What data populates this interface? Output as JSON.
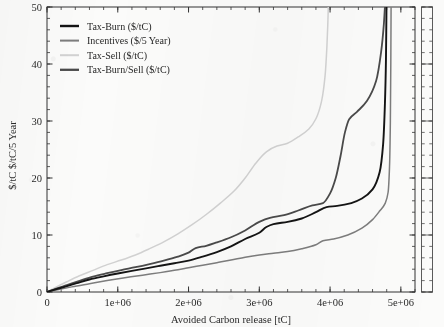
{
  "chart_data": {
    "type": "line",
    "title": "",
    "xlabel": "Avoided Carbon release [tC]",
    "ylabel": "$/tC   $/tC/5 Year",
    "ylabel_parts": [
      "$/tC",
      "$/tC/5 Year"
    ],
    "xlim": [
      0,
      5200000
    ],
    "ylim": [
      0,
      50
    ],
    "xticks": [
      0,
      1000000,
      2000000,
      3000000,
      4000000,
      5000000
    ],
    "xticklabels": [
      "0",
      "1e+06",
      "2e+06",
      "3e+06",
      "4e+06",
      "5e+06"
    ],
    "yticks": [
      0,
      10,
      20,
      30,
      40,
      50
    ],
    "yticklabels": [
      "0",
      "10",
      "20",
      "30",
      "40",
      "50"
    ],
    "x_minor_tick_interval": 200000,
    "y_minor_tick_interval": 2,
    "grid": false,
    "legend_position": "upper left",
    "series": [
      {
        "name": "Tax-Burn ($/tC)",
        "color": "#141414",
        "width": 1.9,
        "points": [
          [
            0,
            0
          ],
          [
            120000,
            0.45
          ],
          [
            260000,
            0.95
          ],
          [
            420000,
            1.55
          ],
          [
            600000,
            2.2
          ],
          [
            800000,
            2.75
          ],
          [
            1000000,
            3.25
          ],
          [
            1200000,
            3.7
          ],
          [
            1400000,
            4.15
          ],
          [
            1600000,
            4.6
          ],
          [
            1800000,
            5.05
          ],
          [
            2000000,
            5.5
          ],
          [
            2200000,
            6.2
          ],
          [
            2400000,
            7.0
          ],
          [
            2600000,
            8.0
          ],
          [
            2800000,
            9.3
          ],
          [
            3000000,
            10.4
          ],
          [
            3100000,
            11.4
          ],
          [
            3200000,
            11.9
          ],
          [
            3400000,
            12.3
          ],
          [
            3600000,
            12.9
          ],
          [
            3800000,
            14.0
          ],
          [
            3950000,
            14.9
          ],
          [
            4100000,
            15.1
          ],
          [
            4300000,
            15.6
          ],
          [
            4450000,
            16.4
          ],
          [
            4600000,
            18.0
          ],
          [
            4700000,
            21.0
          ],
          [
            4750000,
            26.0
          ],
          [
            4775000,
            33.0
          ],
          [
            4790000,
            41.0
          ],
          [
            4797000,
            50.0
          ]
        ]
      },
      {
        "name": "Incentives ($/5 Year)",
        "color": "#7d7d7d",
        "width": 1.5,
        "points": [
          [
            0,
            0
          ],
          [
            150000,
            0.4
          ],
          [
            350000,
            0.9
          ],
          [
            600000,
            1.45
          ],
          [
            850000,
            2.0
          ],
          [
            1100000,
            2.5
          ],
          [
            1350000,
            2.95
          ],
          [
            1600000,
            3.4
          ],
          [
            1850000,
            3.9
          ],
          [
            2000000,
            4.25
          ],
          [
            2200000,
            4.7
          ],
          [
            2400000,
            5.15
          ],
          [
            2600000,
            5.6
          ],
          [
            2800000,
            6.1
          ],
          [
            3000000,
            6.5
          ],
          [
            3200000,
            6.8
          ],
          [
            3400000,
            7.1
          ],
          [
            3600000,
            7.6
          ],
          [
            3800000,
            8.3
          ],
          [
            3900000,
            9.0
          ],
          [
            4050000,
            9.3
          ],
          [
            4250000,
            10.0
          ],
          [
            4450000,
            11.2
          ],
          [
            4600000,
            12.7
          ],
          [
            4700000,
            14.2
          ],
          [
            4780000,
            15.6
          ],
          [
            4820000,
            17.5
          ],
          [
            4840000,
            22.0
          ],
          [
            4852000,
            30.0
          ],
          [
            4858000,
            40.0
          ],
          [
            4862000,
            50.0
          ]
        ]
      },
      {
        "name": "Tax-Sell ($/tC)",
        "color": "#d2d2d2",
        "width": 1.5,
        "points": [
          [
            0,
            0
          ],
          [
            120000,
            0.8
          ],
          [
            280000,
            1.8
          ],
          [
            450000,
            2.8
          ],
          [
            650000,
            3.8
          ],
          [
            850000,
            4.8
          ],
          [
            1050000,
            5.6
          ],
          [
            1250000,
            6.5
          ],
          [
            1450000,
            7.6
          ],
          [
            1650000,
            8.8
          ],
          [
            1850000,
            10.2
          ],
          [
            2050000,
            11.8
          ],
          [
            2250000,
            13.6
          ],
          [
            2450000,
            15.6
          ],
          [
            2650000,
            17.8
          ],
          [
            2800000,
            20.0
          ],
          [
            2950000,
            22.6
          ],
          [
            3100000,
            24.6
          ],
          [
            3250000,
            25.6
          ],
          [
            3400000,
            26.1
          ],
          [
            3550000,
            27.2
          ],
          [
            3700000,
            28.6
          ],
          [
            3800000,
            30.4
          ],
          [
            3880000,
            33.5
          ],
          [
            3930000,
            38.0
          ],
          [
            3955000,
            43.0
          ],
          [
            3968000,
            47.0
          ],
          [
            3975000,
            50.0
          ]
        ]
      },
      {
        "name": "Tax-Burn/Sell ($/tC)",
        "color": "#4a4a4a",
        "width": 1.8,
        "points": [
          [
            0,
            0
          ],
          [
            120000,
            0.55
          ],
          [
            280000,
            1.2
          ],
          [
            460000,
            1.95
          ],
          [
            650000,
            2.7
          ],
          [
            850000,
            3.3
          ],
          [
            1050000,
            3.85
          ],
          [
            1250000,
            4.35
          ],
          [
            1450000,
            4.9
          ],
          [
            1650000,
            5.5
          ],
          [
            1850000,
            6.2
          ],
          [
            2000000,
            6.9
          ],
          [
            2100000,
            7.7
          ],
          [
            2250000,
            8.1
          ],
          [
            2400000,
            8.7
          ],
          [
            2600000,
            9.6
          ],
          [
            2800000,
            10.8
          ],
          [
            3000000,
            12.3
          ],
          [
            3150000,
            13.0
          ],
          [
            3350000,
            13.5
          ],
          [
            3550000,
            14.3
          ],
          [
            3750000,
            15.2
          ],
          [
            3900000,
            15.6
          ],
          [
            4000000,
            17.3
          ],
          [
            4080000,
            20.0
          ],
          [
            4150000,
            24.0
          ],
          [
            4210000,
            28.0
          ],
          [
            4270000,
            30.3
          ],
          [
            4380000,
            31.6
          ],
          [
            4520000,
            33.5
          ],
          [
            4650000,
            37.0
          ],
          [
            4720000,
            42.0
          ],
          [
            4760000,
            47.0
          ],
          [
            4775000,
            50.0
          ]
        ]
      }
    ],
    "legend": [
      {
        "label": "Tax-Burn ($/tC)",
        "color": "#141414"
      },
      {
        "label": "Incentives ($/5 Year)",
        "color": "#7d7d7d"
      },
      {
        "label": "Tax-Sell ($/tC)",
        "color": "#d2d2d2"
      },
      {
        "label": "Tax-Burn/Sell ($/tC)",
        "color": "#4a4a4a"
      }
    ]
  }
}
